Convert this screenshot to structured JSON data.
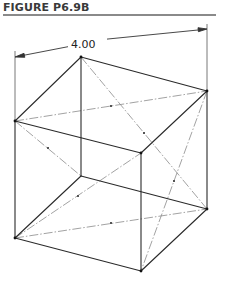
{
  "figure": {
    "title": "FIGURE P6.9B"
  },
  "dimension": {
    "label": "4.00"
  },
  "colors": {
    "edge": "#2a2a2a",
    "centerline": "#8a8a8a",
    "title": "#3a3a3a",
    "rule": "#8a8a8a"
  },
  "cube": {
    "vertices": {
      "A_top_left": [
        15,
        121
      ],
      "B_top_back": [
        81,
        57
      ],
      "C_top_right": [
        207,
        91
      ],
      "D_top_front": [
        141,
        153
      ],
      "E_bottom_left": [
        15,
        238
      ],
      "F_bottom_back": [
        81,
        176
      ],
      "G_bottom_right": [
        207,
        209
      ],
      "H_bottom_front": [
        141,
        271
      ]
    },
    "centerlines": [
      "A-C",
      "B-G",
      "A-F",
      "E-D",
      "E-G",
      "C-H"
    ]
  }
}
